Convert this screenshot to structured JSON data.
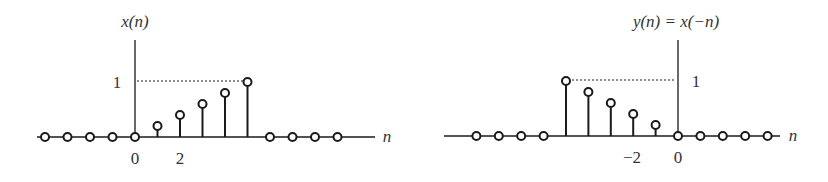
{
  "chart_data": [
    {
      "type": "stem",
      "title": "x(n)",
      "xlabel": "n",
      "ylabel": "x(n)",
      "x": [
        -4,
        -3,
        -2,
        -1,
        0,
        1,
        2,
        3,
        4,
        5,
        6,
        7,
        8,
        9
      ],
      "values": [
        0,
        0,
        0,
        0,
        0,
        0.2,
        0.4,
        0.6,
        0.8,
        1,
        0,
        0,
        0,
        0
      ],
      "x_tick_labels": [
        {
          "n": 0,
          "label": "0"
        },
        {
          "n": 2,
          "label": "2"
        }
      ],
      "y_tick_labels": [
        {
          "y": 1,
          "label": "1"
        }
      ],
      "reference_line": {
        "y": 1,
        "style": "dotted"
      },
      "grid": false
    },
    {
      "type": "stem",
      "title": "y(n) = x(−n)",
      "xlabel": "n",
      "ylabel": "y(n) = x(−n)",
      "x": [
        -9,
        -8,
        -7,
        -6,
        -5,
        -4,
        -3,
        -2,
        -1,
        0,
        1,
        2,
        3,
        4
      ],
      "values": [
        0,
        0,
        0,
        0,
        1,
        0.8,
        0.6,
        0.4,
        0.2,
        0,
        0,
        0,
        0,
        0
      ],
      "x_tick_labels": [
        {
          "n": -2,
          "label": "−2"
        },
        {
          "n": 0,
          "label": "0"
        }
      ],
      "y_tick_labels": [
        {
          "y": 1,
          "label": "1"
        }
      ],
      "reference_line": {
        "y": 1,
        "style": "dotted"
      },
      "grid": false
    }
  ],
  "left_plot": {
    "ylabel": "x(n)",
    "xlabel": "n",
    "ytick": "1",
    "xtick0": "0",
    "xtick2": "2"
  },
  "right_plot": {
    "ylabel": "y(n) = x(−n)",
    "xlabel": "n",
    "ytick": "1",
    "xtickm2": "−2",
    "xtick0": "0"
  },
  "colors": {
    "stroke": "#1a1a1a",
    "text": "#333333",
    "background": "#ffffff"
  }
}
